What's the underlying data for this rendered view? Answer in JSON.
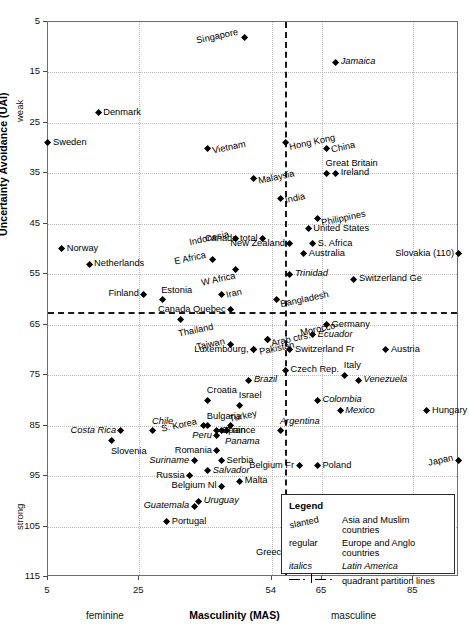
{
  "chart_data": {
    "type": "scatter",
    "title": "",
    "xlabel": "Masculinity (MAS)",
    "ylabel": "Uncertainty Avoidance (UAI)",
    "xlim": [
      5,
      95
    ],
    "ylim": [
      5,
      115
    ],
    "y_inverted": true,
    "grid": true,
    "xticks": [
      5,
      25,
      54,
      65,
      85
    ],
    "yticks": [
      5,
      15,
      25,
      35,
      45,
      55,
      65,
      75,
      85,
      95,
      105,
      115
    ],
    "x_axis_low_label": "feminine",
    "x_axis_high_label": "masculine",
    "y_axis_low_label": "weak",
    "y_axis_high_label": "strong",
    "quadrant_lines": {
      "x": 57,
      "y": 62.5
    },
    "legend": {
      "title": "Legend",
      "rows": [
        {
          "key": "slanted",
          "value": "Asia and Muslim countries",
          "style": "slanted"
        },
        {
          "key": "regular",
          "value": "Europe and Anglo countries",
          "style": "regular"
        },
        {
          "key": "italics",
          "value": "Latin America",
          "style": "italics"
        },
        {
          "key": "dash-dot-line",
          "value": "quadrant partition lines",
          "style": "line"
        }
      ]
    },
    "points": [
      {
        "label": "Singapore",
        "x": 48,
        "y": 8,
        "group": "asia",
        "pos": "left"
      },
      {
        "label": "Jamaica",
        "x": 68,
        "y": 13,
        "group": "latin",
        "pos": "right"
      },
      {
        "label": "Denmark",
        "x": 16,
        "y": 23,
        "group": "euro",
        "pos": "right"
      },
      {
        "label": "Sweden",
        "x": 5,
        "y": 29,
        "group": "euro",
        "pos": "right"
      },
      {
        "label": "Vietnam",
        "x": 40,
        "y": 30,
        "group": "asia",
        "pos": "right"
      },
      {
        "label": "Hong Kong",
        "x": 57,
        "y": 29,
        "group": "asia",
        "pos": "right"
      },
      {
        "label": "China",
        "x": 66,
        "y": 30,
        "group": "asia",
        "pos": "right"
      },
      {
        "label": "Great Britain",
        "x": 66,
        "y": 35,
        "group": "euro",
        "pos": "above"
      },
      {
        "label": "Ireland",
        "x": 68,
        "y": 35,
        "group": "euro",
        "pos": "right"
      },
      {
        "label": "Malaysia",
        "x": 50,
        "y": 36,
        "group": "asia",
        "pos": "right"
      },
      {
        "label": "India",
        "x": 56,
        "y": 40,
        "group": "asia",
        "pos": "right"
      },
      {
        "label": "Philippines",
        "x": 64,
        "y": 44,
        "group": "asia",
        "pos": "right"
      },
      {
        "label": "Indonesia",
        "x": 46,
        "y": 48,
        "group": "asia",
        "pos": "left"
      },
      {
        "label": "Canada total",
        "x": 52,
        "y": 48,
        "group": "euro",
        "pos": "left"
      },
      {
        "label": "United States",
        "x": 62,
        "y": 46,
        "group": "euro",
        "pos": "right"
      },
      {
        "label": "S. Africa",
        "x": 63,
        "y": 49,
        "group": "euro",
        "pos": "right"
      },
      {
        "label": "New Zealand",
        "x": 58,
        "y": 49,
        "group": "euro",
        "pos": "left"
      },
      {
        "label": "Australia",
        "x": 61,
        "y": 51,
        "group": "euro",
        "pos": "right"
      },
      {
        "label": "Slovakia (110)",
        "x": 95,
        "y": 51,
        "group": "euro",
        "pos": "left"
      },
      {
        "label": "Norway",
        "x": 8,
        "y": 50,
        "group": "euro",
        "pos": "right"
      },
      {
        "label": "Netherlands",
        "x": 14,
        "y": 53,
        "group": "euro",
        "pos": "right"
      },
      {
        "label": "E Africa",
        "x": 41,
        "y": 52,
        "group": "asia",
        "pos": "left"
      },
      {
        "label": "W Africa",
        "x": 46,
        "y": 54,
        "group": "asia",
        "pos": "below-l"
      },
      {
        "label": "Trinidad",
        "x": 58,
        "y": 55,
        "group": "latin",
        "pos": "right"
      },
      {
        "label": "Switzerland Ge",
        "x": 72,
        "y": 56,
        "group": "euro",
        "pos": "right"
      },
      {
        "label": "Iran",
        "x": 43,
        "y": 59,
        "group": "asia",
        "pos": "right"
      },
      {
        "label": "Finland",
        "x": 26,
        "y": 59,
        "group": "euro",
        "pos": "left"
      },
      {
        "label": "Estonia",
        "x": 30,
        "y": 60,
        "group": "euro",
        "pos": "above"
      },
      {
        "label": "Canada Quebec",
        "x": 45,
        "y": 62,
        "group": "euro",
        "pos": "left"
      },
      {
        "label": "Bangladesh",
        "x": 55,
        "y": 60,
        "group": "asia",
        "pos": "right"
      },
      {
        "label": "Thailand",
        "x": 34,
        "y": 64,
        "group": "asia",
        "pos": "below"
      },
      {
        "label": "Arab ctrs.",
        "x": 53,
        "y": 68,
        "group": "asia",
        "pos": "right"
      },
      {
        "label": "Morocco",
        "x": 53,
        "y": 68,
        "group": "asia",
        "pos": "right2"
      },
      {
        "label": "Germany",
        "x": 66,
        "y": 65,
        "group": "euro",
        "pos": "right"
      },
      {
        "label": "Ecuador",
        "x": 63,
        "y": 67,
        "group": "latin",
        "pos": "right"
      },
      {
        "label": "Taiwan",
        "x": 45,
        "y": 69,
        "group": "asia",
        "pos": "left"
      },
      {
        "label": "Switzerland Fr",
        "x": 58,
        "y": 70,
        "group": "euro",
        "pos": "right"
      },
      {
        "label": "Austria",
        "x": 79,
        "y": 70,
        "group": "euro",
        "pos": "right"
      },
      {
        "label": "Luxembourg,",
        "x": 50,
        "y": 70,
        "group": "euro",
        "pos": "left"
      },
      {
        "label": "Pakistan",
        "x": 50,
        "y": 70,
        "group": "asia",
        "pos": "lxpk"
      },
      {
        "label": "Czech Rep.",
        "x": 57,
        "y": 74,
        "group": "euro",
        "pos": "right"
      },
      {
        "label": "Italy",
        "x": 70,
        "y": 75,
        "group": "euro",
        "pos": "above"
      },
      {
        "label": "Brazil",
        "x": 49,
        "y": 76,
        "group": "latin",
        "pos": "right"
      },
      {
        "label": "Venezuela",
        "x": 73,
        "y": 76,
        "group": "latin",
        "pos": "right"
      },
      {
        "label": "Croatia",
        "x": 40,
        "y": 80,
        "group": "euro",
        "pos": "above"
      },
      {
        "label": "Israel",
        "x": 47,
        "y": 81,
        "group": "euro",
        "pos": "above"
      },
      {
        "label": "Colombia",
        "x": 64,
        "y": 80,
        "group": "latin",
        "pos": "right"
      },
      {
        "label": "Hungary",
        "x": 88,
        "y": 82,
        "group": "euro",
        "pos": "right"
      },
      {
        "label": "Mexico",
        "x": 69,
        "y": 82,
        "group": "latin",
        "pos": "right"
      },
      {
        "label": "Costa Rica",
        "x": 21,
        "y": 86,
        "group": "latin",
        "pos": "left"
      },
      {
        "label": "Chile",
        "x": 28,
        "y": 86,
        "group": "latin",
        "pos": "above"
      },
      {
        "label": "Bulgaria",
        "x": 40,
        "y": 85,
        "group": "euro",
        "pos": "above"
      },
      {
        "label": "Turkey",
        "x": 45,
        "y": 85,
        "group": "asia",
        "pos": "above"
      },
      {
        "label": "S. Korea",
        "x": 39,
        "y": 85,
        "group": "asia",
        "pos": "left"
      },
      {
        "label": "France",
        "x": 43,
        "y": 86,
        "group": "euro",
        "pos": "right"
      },
      {
        "label": "Peru",
        "x": 42,
        "y": 87,
        "group": "latin",
        "pos": "left"
      },
      {
        "label": "Spain",
        "x": 42,
        "y": 86,
        "group": "euro",
        "pos": "right"
      },
      {
        "label": "Panama",
        "x": 44,
        "y": 86,
        "group": "latin",
        "pos": "below"
      },
      {
        "label": "Slovenia",
        "x": 19,
        "y": 88,
        "group": "euro",
        "pos": "below"
      },
      {
        "label": "Romania",
        "x": 42,
        "y": 90,
        "group": "euro",
        "pos": "left"
      },
      {
        "label": "Suriname",
        "x": 37,
        "y": 92,
        "group": "latin",
        "pos": "left"
      },
      {
        "label": "Serbia",
        "x": 43,
        "y": 92,
        "group": "euro",
        "pos": "right"
      },
      {
        "label": "Salvador",
        "x": 40,
        "y": 94,
        "group": "latin",
        "pos": "right"
      },
      {
        "label": "Russia",
        "x": 36,
        "y": 95,
        "group": "euro",
        "pos": "left"
      },
      {
        "label": "Belgium Nl",
        "x": 43,
        "y": 97,
        "group": "euro",
        "pos": "left"
      },
      {
        "label": "Malta",
        "x": 47,
        "y": 96,
        "group": "euro",
        "pos": "right"
      },
      {
        "label": "Poland",
        "x": 64,
        "y": 93,
        "group": "euro",
        "pos": "right"
      },
      {
        "label": "Belgium Fr",
        "x": 60,
        "y": 93,
        "group": "euro",
        "pos": "left"
      },
      {
        "label": "Japan",
        "x": 95,
        "y": 92,
        "group": "asia",
        "pos": "left"
      },
      {
        "label": "Argentina",
        "x": 56,
        "y": 86,
        "group": "latin",
        "pos": "above"
      },
      {
        "label": "Guatemala",
        "x": 37,
        "y": 101,
        "group": "latin",
        "pos": "left"
      },
      {
        "label": "Uruguay",
        "x": 38,
        "y": 100,
        "group": "latin",
        "pos": "right"
      },
      {
        "label": "Portugal",
        "x": 31,
        "y": 104,
        "group": "euro",
        "pos": "right"
      },
      {
        "label": "Greece",
        "x": 57,
        "y": 112,
        "group": "euro",
        "pos": "above-l"
      }
    ]
  }
}
